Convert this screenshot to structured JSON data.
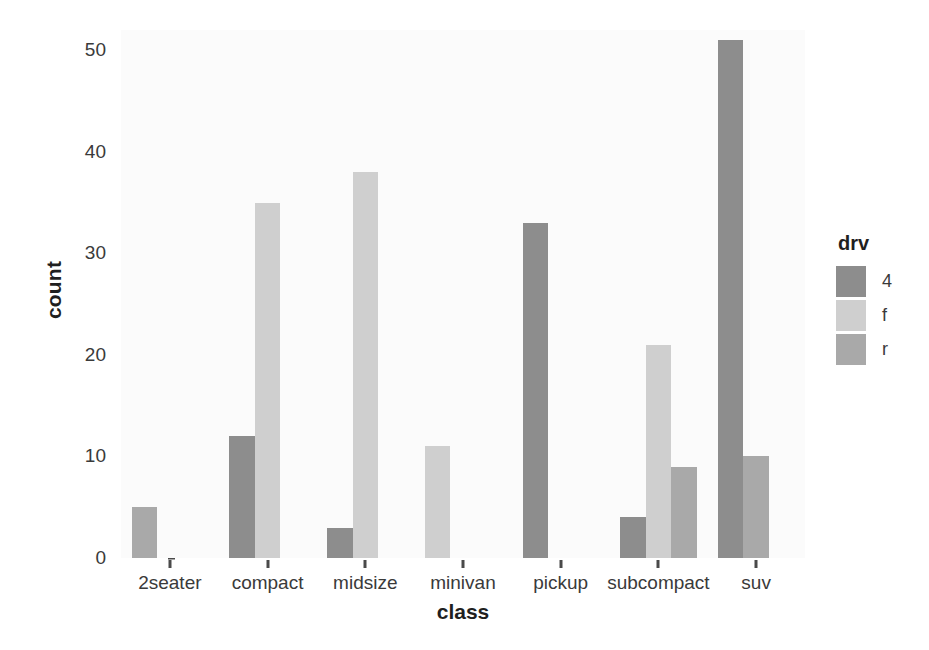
{
  "chart_data": {
    "type": "bar",
    "title": "",
    "subtitle": "",
    "xlabel": "class",
    "ylabel": "count",
    "categories": [
      "2seater",
      "compact",
      "midsize",
      "minivan",
      "pickup",
      "subcompact",
      "suv"
    ],
    "series": [
      {
        "name": "4",
        "color": "#8d8d8d",
        "values": [
          0,
          12,
          3,
          0,
          33,
          4,
          51
        ]
      },
      {
        "name": "f",
        "color": "#cfcfcf",
        "values": [
          0,
          35,
          38,
          11,
          0,
          21,
          0
        ]
      },
      {
        "name": "r",
        "color": "#a9a9a9",
        "values": [
          5,
          0,
          0,
          0,
          0,
          9,
          10
        ]
      }
    ],
    "ylim": [
      0,
      52
    ],
    "yticks": [
      0,
      10,
      20,
      30,
      40,
      50
    ],
    "ytick_labels": [
      "0",
      "10",
      "20",
      "30",
      "40",
      "50"
    ],
    "grid": false,
    "legend_position": "right",
    "legend_title": "drv",
    "bar_mode": "dodge",
    "panel_background": "#fbfbfb",
    "plot_background": "#ffffff"
  },
  "legend": {
    "title": "drv",
    "entries": [
      {
        "label": "4",
        "color": "#8d8d8d"
      },
      {
        "label": "f",
        "color": "#cfcfcf"
      },
      {
        "label": "r",
        "color": "#a9a9a9"
      }
    ]
  },
  "axes": {
    "y": {
      "title": "count",
      "tick_labels": [
        "50",
        "40",
        "30",
        "20",
        "10",
        "0"
      ]
    },
    "x": {
      "title": "class",
      "tick_labels": [
        "2seater",
        "compact",
        "midsize",
        "minivan",
        "pickup",
        "subcompact",
        "suv"
      ]
    }
  }
}
